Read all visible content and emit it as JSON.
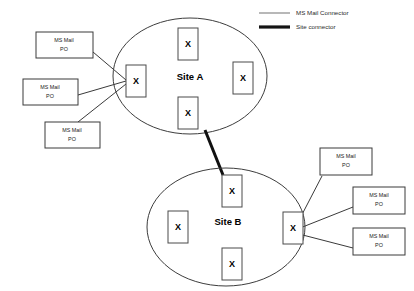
{
  "diagram": {
    "colors": {
      "background": "#ffffff",
      "box_stroke": "#3a3a3a",
      "ellipse_stroke": "#3d3d3d",
      "mail_connector": "#3a3a3a",
      "site_connector": "#111111",
      "legend_thin": "#9a9a9a",
      "legend_thick": "#141414",
      "text": "#000000"
    }
  },
  "legend": {
    "items": [
      {
        "label": "MS Mail Connector",
        "style": "thin-line",
        "color": "#9a9a9a"
      },
      {
        "label": "Site connector",
        "style": "thick-line",
        "color": "#141414"
      }
    ]
  },
  "sites": [
    {
      "id": "site-a",
      "label": "Site A",
      "servers": [
        {
          "id": "site-a-gateway",
          "label": "X",
          "role": "gateway"
        },
        {
          "id": "site-a-top",
          "label": "X",
          "role": "server"
        },
        {
          "id": "site-a-right",
          "label": "X",
          "role": "server"
        },
        {
          "id": "site-a-bottom",
          "label": "X",
          "role": "server"
        }
      ]
    },
    {
      "id": "site-b",
      "label": "Site B",
      "servers": [
        {
          "id": "site-b-gateway",
          "label": "X",
          "role": "gateway"
        },
        {
          "id": "site-b-top",
          "label": "X",
          "role": "server"
        },
        {
          "id": "site-b-left",
          "label": "X",
          "role": "server"
        },
        {
          "id": "site-b-bottom",
          "label": "X",
          "role": "server"
        }
      ]
    }
  ],
  "post_offices": {
    "left": [
      {
        "id": "po-left-1",
        "line1": "MS Mail",
        "line2": "PO"
      },
      {
        "id": "po-left-2",
        "line1": "MS Mail",
        "line2": "PO"
      },
      {
        "id": "po-left-3",
        "line1": "MS Mail",
        "line2": "PO"
      }
    ],
    "right": [
      {
        "id": "po-right-1",
        "line1": "MS Mail",
        "line2": "PO"
      },
      {
        "id": "po-right-2",
        "line1": "MS Mail",
        "line2": "PO"
      },
      {
        "id": "po-right-3",
        "line1": "MS Mail",
        "line2": "PO"
      }
    ]
  }
}
